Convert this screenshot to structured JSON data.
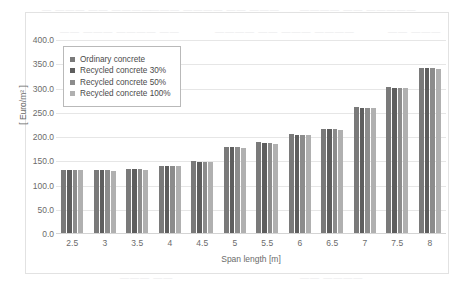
{
  "chart_data": {
    "type": "bar",
    "title": "",
    "xlabel": "Span length [m]",
    "ylabel": "[ Euro/m² ]",
    "categories": [
      "2.5",
      "3",
      "3.5",
      "4",
      "4.5",
      "5",
      "5.5",
      "6",
      "6.5",
      "7",
      "7.5",
      "8"
    ],
    "ylim": [
      0,
      400
    ],
    "yticks": [
      "0.0",
      "50.0",
      "100.0",
      "150.0",
      "200.0",
      "250.0",
      "300.0",
      "350.0",
      "400.0"
    ],
    "ytick_values": [
      0,
      50,
      100,
      150,
      200,
      250,
      300,
      350,
      400
    ],
    "grid": true,
    "legend_position": "top-left-inside",
    "series": [
      {
        "name": "Ordinary concrete",
        "color": "#7a7a7a",
        "values": [
          130,
          129,
          131,
          139,
          148,
          178,
          187,
          204,
          215,
          259,
          301,
          341
        ]
      },
      {
        "name": "Recycled concrete 30%",
        "color": "#5e5e5e",
        "values": [
          130,
          129,
          131,
          139,
          147,
          177,
          186,
          203,
          215,
          258,
          300,
          340
        ]
      },
      {
        "name": "Recycled concrete 50%",
        "color": "#8c8c8c",
        "values": [
          130,
          129,
          131,
          139,
          147,
          177,
          186,
          203,
          214,
          258,
          300,
          340
        ]
      },
      {
        "name": "Recycled concrete 100%",
        "color": "#b0b0b0",
        "values": [
          129,
          128,
          130,
          138,
          146,
          176,
          184,
          202,
          212,
          257,
          298,
          339
        ]
      }
    ]
  },
  "legend": {
    "items": [
      {
        "label": "Ordinary concrete"
      },
      {
        "label": "Recycled concrete 30%"
      },
      {
        "label": "Recycled concrete 50%"
      },
      {
        "label": "Recycled concrete 100%"
      }
    ]
  },
  "background_artifacts": [
    {
      "text": "— ———  —— ————",
      "x": 42,
      "y": 4
    },
    {
      "text": "——— ———— —— ———",
      "x": 150,
      "y": 4
    },
    {
      "text": "———— —— —————",
      "x": 300,
      "y": 4
    },
    {
      "text": "—— ———  ———— ——",
      "x": 60,
      "y": 26
    },
    {
      "text": "———— —— ——— ————",
      "x": 215,
      "y": 26
    },
    {
      "text": "—— ———",
      "x": 388,
      "y": 26
    },
    {
      "text": "——— ——",
      "x": 120,
      "y": 272
    },
    {
      "text": "—— ————",
      "x": 300,
      "y": 272
    }
  ]
}
